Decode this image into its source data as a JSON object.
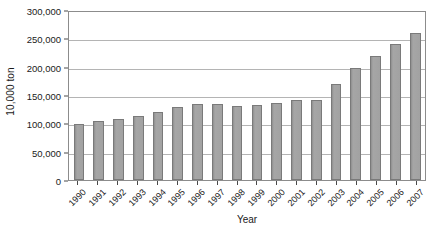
{
  "chart_data": {
    "type": "bar",
    "title": "",
    "xlabel": "Year",
    "ylabel": "10,000 ton",
    "ylim": [
      0,
      300000
    ],
    "ytick_values": [
      0,
      50000,
      100000,
      150000,
      200000,
      250000,
      300000
    ],
    "ytick_labels": [
      "0",
      "50,000",
      "100,000",
      "150,000",
      "200,000",
      "250,000",
      "300,000"
    ],
    "grid": true,
    "legend": "none",
    "categories": [
      "1990",
      "1991",
      "1992",
      "1993",
      "1994",
      "1995",
      "1996",
      "1997",
      "1998",
      "1999",
      "2000",
      "2001",
      "2002",
      "2003",
      "2004",
      "2005",
      "2006",
      "2007"
    ],
    "values": [
      99000,
      104000,
      108000,
      113000,
      120000,
      129000,
      135000,
      135000,
      131000,
      132000,
      136000,
      141000,
      142000,
      170000,
      198000,
      219000,
      240000,
      259000
    ],
    "bar_color": "#9d9d9d",
    "bar_edge_color": "#7a7a7a",
    "gridline_color": "#b4b4b4",
    "axis_color": "#8c8c8c"
  }
}
